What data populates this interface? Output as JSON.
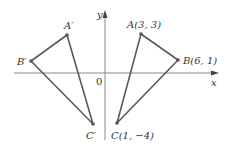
{
  "diagram": {
    "axes": {
      "x_label": "x",
      "y_label": "y",
      "origin_label": "0",
      "axis_color": "#777777"
    },
    "triangle_original": {
      "color": "#555555",
      "points": {
        "A": {
          "label": "A(3, 3)",
          "x": 3,
          "y": 3
        },
        "B": {
          "label": "B(6, 1)",
          "x": 6,
          "y": 1
        },
        "C": {
          "label": "C(1, −4)",
          "x": 1,
          "y": -4
        }
      }
    },
    "triangle_reflected": {
      "color": "#555555",
      "points": {
        "A_prime": {
          "label": "A′"
        },
        "B_prime": {
          "label": "B′"
        },
        "C_prime": {
          "label": "C′"
        }
      }
    }
  }
}
